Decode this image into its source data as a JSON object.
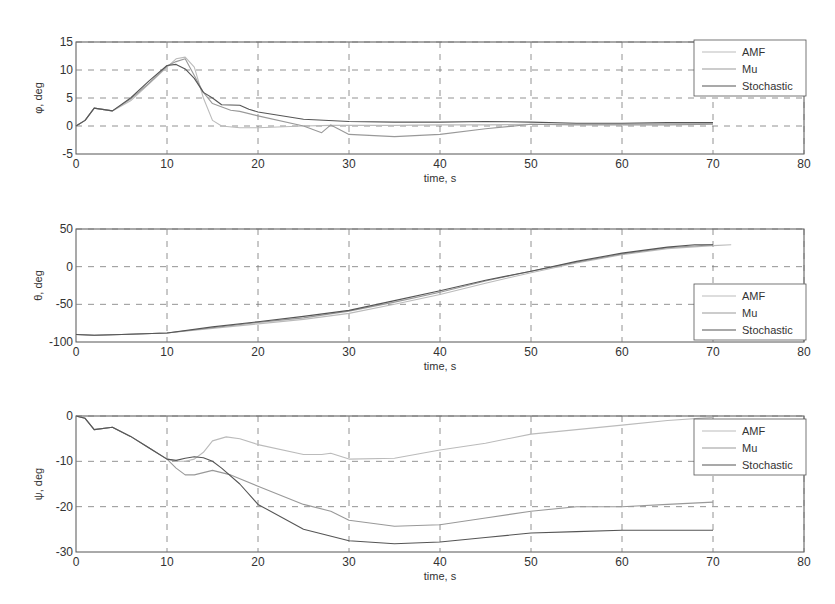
{
  "figure": {
    "background": "#ffffff",
    "grid_color": "#777777",
    "axis_color": "#555555"
  },
  "chart_data": [
    {
      "type": "line",
      "title": "",
      "xlabel": "time, s",
      "ylabel": "φ, deg",
      "xlim": [
        0,
        80
      ],
      "ylim": [
        -5,
        15
      ],
      "xticks": [
        0,
        10,
        20,
        30,
        40,
        50,
        60,
        70,
        80
      ],
      "yticks": [
        -5,
        0,
        5,
        10,
        15
      ],
      "grid": true,
      "legend_position": "upper right",
      "legend": [
        "AMF",
        "Mu",
        "Stochastic"
      ],
      "series": [
        {
          "name": "AMF",
          "color": "#bbbbbb",
          "x": [
            0,
            1,
            2,
            4,
            6,
            8,
            10,
            11,
            12,
            13,
            14,
            15,
            16,
            18,
            20,
            25,
            28,
            30,
            35,
            40,
            45,
            50,
            55,
            60,
            65,
            70
          ],
          "y": [
            0,
            1,
            3.2,
            2.7,
            4.5,
            7.5,
            10.5,
            12,
            12.3,
            10.5,
            5,
            1,
            0,
            -0.3,
            -0.3,
            0,
            0.1,
            0.1,
            0.1,
            0.2,
            0.2,
            0.3,
            0.3,
            0.3,
            0.4,
            0.4
          ]
        },
        {
          "name": "Mu",
          "color": "#999999",
          "x": [
            0,
            1,
            2,
            4,
            6,
            8,
            10,
            11,
            12,
            13,
            14,
            15,
            17,
            18,
            20,
            25,
            27,
            28,
            30,
            35,
            40,
            45,
            50,
            55,
            60,
            65,
            70
          ],
          "y": [
            0,
            1,
            3.2,
            2.7,
            4.8,
            7.6,
            10.7,
            11.5,
            12,
            9,
            6,
            4,
            2.8,
            2.6,
            1.8,
            0,
            -1.2,
            0.2,
            -1.5,
            -1.9,
            -1.5,
            -0.5,
            0.3,
            0.2,
            0.2,
            0.2,
            0.3
          ]
        },
        {
          "name": "Stochastic",
          "color": "#555555",
          "x": [
            0,
            1,
            2,
            4,
            6,
            8,
            10,
            11,
            12,
            13,
            14,
            15,
            16,
            18,
            19,
            20,
            25,
            30,
            35,
            40,
            45,
            50,
            55,
            60,
            65,
            69,
            70
          ],
          "y": [
            0,
            1,
            3.2,
            2.7,
            5,
            8,
            10.8,
            11,
            10.2,
            8.5,
            6,
            5,
            3.8,
            3.7,
            3,
            2.5,
            1.2,
            0.8,
            0.7,
            0.7,
            0.8,
            0.7,
            0.5,
            0.5,
            0.6,
            0.6,
            0.6
          ]
        }
      ]
    },
    {
      "type": "line",
      "title": "",
      "xlabel": "time, s",
      "ylabel": "θ, deg",
      "xlim": [
        0,
        80
      ],
      "ylim": [
        -100,
        50
      ],
      "xticks": [
        0,
        10,
        20,
        30,
        40,
        50,
        60,
        70,
        80
      ],
      "yticks": [
        -100,
        -50,
        0,
        50
      ],
      "grid": true,
      "legend_position": "lower right",
      "legend": [
        "AMF",
        "Mu",
        "Stochastic"
      ],
      "series": [
        {
          "name": "AMF",
          "color": "#bbbbbb",
          "x": [
            0,
            2,
            5,
            10,
            15,
            20,
            25,
            30,
            35,
            40,
            45,
            50,
            55,
            60,
            65,
            70,
            72
          ],
          "y": [
            -90,
            -91,
            -90,
            -88,
            -82,
            -76,
            -70,
            -62,
            -50,
            -37,
            -22,
            -8,
            5,
            16,
            24,
            28,
            29
          ]
        },
        {
          "name": "Mu",
          "color": "#999999",
          "x": [
            0,
            2,
            5,
            10,
            15,
            20,
            25,
            30,
            35,
            40,
            45,
            50,
            55,
            60,
            65,
            70
          ],
          "y": [
            -90,
            -91,
            -90,
            -88,
            -81,
            -74,
            -68,
            -59,
            -47,
            -34,
            -19,
            -6,
            6,
            17,
            25,
            29
          ]
        },
        {
          "name": "Stochastic",
          "color": "#555555",
          "x": [
            0,
            2,
            5,
            10,
            15,
            20,
            25,
            30,
            35,
            40,
            45,
            50,
            55,
            60,
            65,
            68,
            70
          ],
          "y": [
            -90,
            -91,
            -90,
            -88,
            -80,
            -73,
            -66,
            -58,
            -45,
            -32,
            -18,
            -6,
            7,
            18,
            26,
            29,
            29
          ]
        }
      ]
    },
    {
      "type": "line",
      "title": "",
      "xlabel": "time, s",
      "ylabel": "ψ, deg",
      "xlim": [
        0,
        80
      ],
      "ylim": [
        -30,
        0
      ],
      "xticks": [
        0,
        10,
        20,
        30,
        40,
        50,
        60,
        70,
        80
      ],
      "yticks": [
        -30,
        -20,
        -10,
        0
      ],
      "grid": true,
      "legend_position": "upper right",
      "legend": [
        "AMF",
        "Mu",
        "Stochastic"
      ],
      "series": [
        {
          "name": "AMF",
          "color": "#bbbbbb",
          "x": [
            0,
            1,
            2,
            4,
            6,
            8,
            10,
            11,
            12,
            13,
            14,
            15,
            16.5,
            18,
            20,
            25,
            27,
            28,
            30,
            35,
            40,
            45,
            50,
            55,
            60,
            65,
            70
          ],
          "y": [
            0,
            -0.5,
            -3,
            -2.5,
            -4.5,
            -7,
            -9.5,
            -10,
            -10,
            -9.5,
            -8,
            -5.5,
            -4.6,
            -5,
            -6.3,
            -8.5,
            -8.5,
            -8.2,
            -9.5,
            -9.3,
            -7.5,
            -6,
            -4,
            -3,
            -2,
            -1,
            -0.3
          ]
        },
        {
          "name": "Mu",
          "color": "#999999",
          "x": [
            0,
            1,
            2,
            4,
            6,
            8,
            10,
            11,
            12,
            13,
            15,
            17,
            20,
            25,
            28,
            30,
            35,
            40,
            45,
            50,
            55,
            60,
            65,
            70
          ],
          "y": [
            0,
            -0.5,
            -3,
            -2.5,
            -4.5,
            -7,
            -9.5,
            -11.5,
            -13,
            -13,
            -12,
            -13,
            -15.5,
            -19.5,
            -21,
            -23,
            -24.3,
            -24,
            -22.5,
            -21,
            -20,
            -20,
            -19.5,
            -19
          ]
        },
        {
          "name": "Stochastic",
          "color": "#555555",
          "x": [
            0,
            1,
            2,
            4,
            6,
            8,
            10,
            11,
            12,
            13,
            14,
            15,
            16,
            18,
            20,
            25,
            30,
            35,
            40,
            45,
            50,
            55,
            60,
            65,
            70
          ],
          "y": [
            0,
            -0.5,
            -3,
            -2.5,
            -4.5,
            -7,
            -9.5,
            -9.8,
            -9.3,
            -9,
            -9.2,
            -10,
            -11.5,
            -15,
            -19.5,
            -25,
            -27.5,
            -28.2,
            -27.8,
            -26.8,
            -25.8,
            -25.5,
            -25.2,
            -25.2,
            -25.2
          ]
        }
      ]
    }
  ],
  "panels": [
    {
      "ylabel": "φ, deg",
      "xlabel": "time, s",
      "legend": [
        {
          "label": "AMF"
        },
        {
          "label": "Mu"
        },
        {
          "label": "Stochastic"
        }
      ]
    },
    {
      "ylabel": "θ, deg",
      "xlabel": "time, s",
      "legend": [
        {
          "label": "AMF"
        },
        {
          "label": "Mu"
        },
        {
          "label": "Stochastic"
        }
      ]
    },
    {
      "ylabel": "ψ, deg",
      "xlabel": "time, s",
      "legend": [
        {
          "label": "AMF"
        },
        {
          "label": "Mu"
        },
        {
          "label": "Stochastic"
        }
      ]
    }
  ]
}
